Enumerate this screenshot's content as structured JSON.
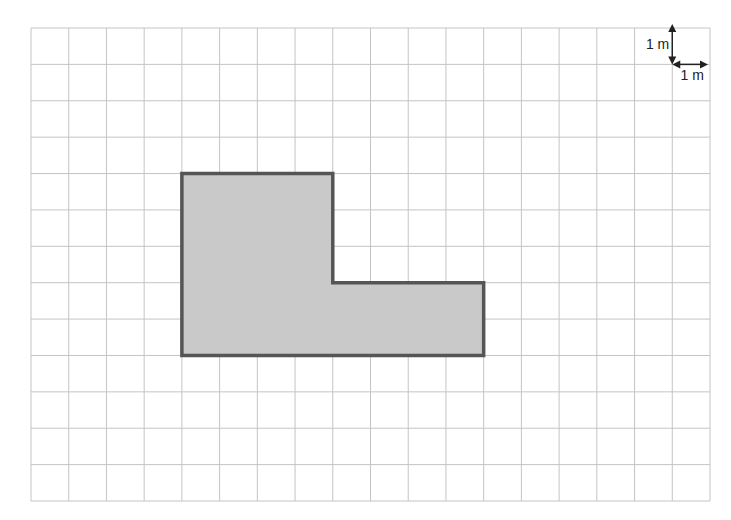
{
  "diagram": {
    "type": "grid-area-figure",
    "grid": {
      "columns": 18,
      "rows": 13,
      "cell_unit": "1 m"
    },
    "shape": {
      "description": "L-shaped polygon",
      "vertices_grid_units": [
        [
          4,
          4
        ],
        [
          8,
          4
        ],
        [
          8,
          7
        ],
        [
          12,
          7
        ],
        [
          12,
          9
        ],
        [
          4,
          9
        ]
      ],
      "fill": "#c9c9c9",
      "stroke": "#555555"
    },
    "scale": {
      "vertical_label": "1 m",
      "horizontal_label": "1 m"
    }
  }
}
